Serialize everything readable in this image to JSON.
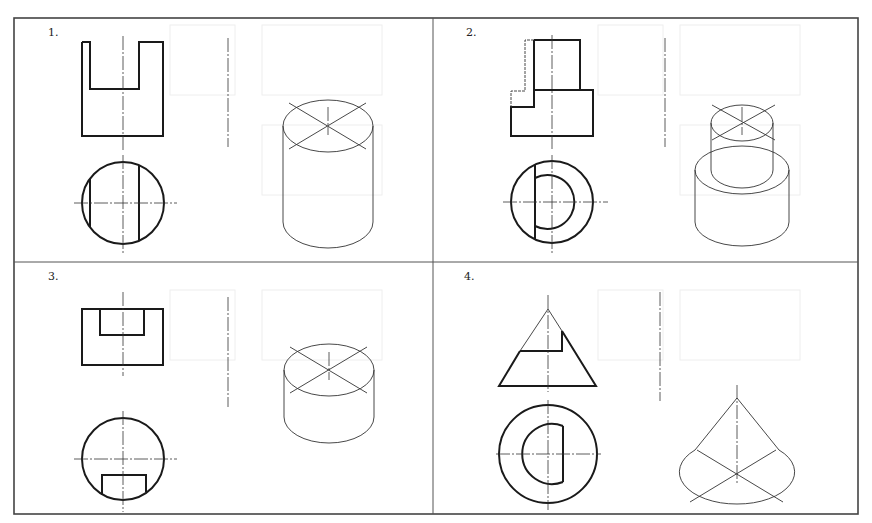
{
  "panels": [
    {
      "number": "1.",
      "description": "Cylinder with rectangular slot cut from top (front view U-shape, top view circle with two chord lines, isometric cylinder)"
    },
    {
      "number": "2.",
      "description": "Stepped cylinder with partial cut (front view stepped block, top view concentric circles with chord, isometric two-tier cylinder)"
    },
    {
      "number": "3.",
      "description": "Short cylinder with rectangular notch (front view rectangle with inner notch, top view circle with slot, isometric short cylinder)"
    },
    {
      "number": "4.",
      "description": "Cone with cutout (front view triangle with notch, top view concentric circles with D-shape, isometric cone)"
    }
  ],
  "colors": {
    "line": "#1a1a1a",
    "border": "#444444",
    "background": "#ffffff"
  }
}
